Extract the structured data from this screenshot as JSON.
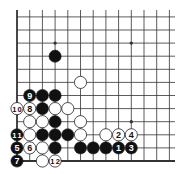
{
  "diagram": {
    "type": "go-board-corner",
    "corner": "bottom-left",
    "columns_shown": 13,
    "rows_shown": 12,
    "colors": {
      "board": "#ffffff",
      "line": "#333333",
      "black_stone": "#111111",
      "white_stone": "#ffffff",
      "stone_outline": "#222222"
    },
    "star_points": [
      {
        "col": 3,
        "row": 9
      },
      {
        "col": 9,
        "row": 9
      },
      {
        "col": 9,
        "row": 3
      }
    ],
    "stones": [
      {
        "color": "black",
        "col": 3,
        "row": 8,
        "label": ""
      },
      {
        "color": "black",
        "col": 2,
        "row": 5,
        "label": ""
      },
      {
        "color": "black",
        "col": 3,
        "row": 5,
        "label": ""
      },
      {
        "color": "black",
        "col": 2,
        "row": 4,
        "label": ""
      },
      {
        "color": "black",
        "col": 3,
        "row": 3,
        "label": ""
      },
      {
        "color": "black",
        "col": 2,
        "row": 2,
        "label": ""
      },
      {
        "color": "black",
        "col": 3,
        "row": 2,
        "label": ""
      },
      {
        "color": "black",
        "col": 4,
        "row": 2,
        "label": ""
      },
      {
        "color": "black",
        "col": 3,
        "row": 1,
        "label": ""
      },
      {
        "color": "black",
        "col": 5,
        "row": 1,
        "label": ""
      },
      {
        "color": "black",
        "col": 6,
        "row": 1,
        "label": ""
      },
      {
        "color": "black",
        "col": 7,
        "row": 1,
        "label": ""
      },
      {
        "color": "white",
        "col": 5,
        "row": 6,
        "label": ""
      },
      {
        "color": "white",
        "col": 3,
        "row": 4,
        "label": ""
      },
      {
        "color": "white",
        "col": 4,
        "row": 4,
        "label": ""
      },
      {
        "color": "white",
        "col": 1,
        "row": 3,
        "label": ""
      },
      {
        "color": "white",
        "col": 2,
        "row": 3,
        "label": ""
      },
      {
        "color": "white",
        "col": 5,
        "row": 3,
        "label": ""
      },
      {
        "color": "white",
        "col": 1,
        "row": 2,
        "label": ""
      },
      {
        "color": "white",
        "col": 5,
        "row": 2,
        "label": ""
      },
      {
        "color": "white",
        "col": 7,
        "row": 2,
        "label": ""
      },
      {
        "color": "white",
        "col": 2,
        "row": 1,
        "label": ""
      },
      {
        "color": "white",
        "col": 2,
        "row": 0,
        "label": ""
      },
      {
        "color": "black",
        "col": 8,
        "row": 1,
        "label": "1"
      },
      {
        "color": "white",
        "col": 8,
        "row": 2,
        "label": "2"
      },
      {
        "color": "black",
        "col": 9,
        "row": 1,
        "label": "3"
      },
      {
        "color": "white",
        "col": 9,
        "row": 2,
        "label": "4"
      },
      {
        "color": "black",
        "col": 0,
        "row": 1,
        "label": "5"
      },
      {
        "color": "white",
        "col": 1,
        "row": 1,
        "label": "6"
      },
      {
        "color": "black",
        "col": 0,
        "row": 0,
        "label": "7"
      },
      {
        "color": "white",
        "col": 1,
        "row": 4,
        "label": "8"
      },
      {
        "color": "black",
        "col": 1,
        "row": 5,
        "label": "9"
      },
      {
        "color": "white",
        "col": 0,
        "row": 4,
        "label": "10"
      },
      {
        "color": "black",
        "col": 0,
        "row": 2,
        "label": "11"
      },
      {
        "color": "white",
        "col": 3,
        "row": 0,
        "label": "12"
      }
    ]
  }
}
